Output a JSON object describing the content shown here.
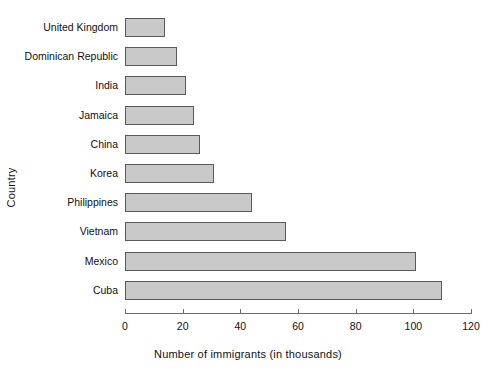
{
  "chart_data": {
    "type": "bar",
    "orientation": "horizontal",
    "title": "",
    "xlabel": "Number of immigrants (in thousands)",
    "ylabel": "Country",
    "categories": [
      "United Kingdom",
      "Dominican Republic",
      "India",
      "Jamaica",
      "China",
      "Korea",
      "Philippines",
      "Vietnam",
      "Mexico",
      "Cuba"
    ],
    "values": [
      14,
      18,
      21,
      24,
      26,
      31,
      44,
      56,
      101,
      110
    ],
    "xlim": [
      0,
      120
    ],
    "xticks": [
      0,
      20,
      40,
      60,
      80,
      100,
      120
    ],
    "xtick_labels": [
      "0",
      "20",
      "40",
      "60",
      "80",
      "100",
      "120"
    ],
    "grid": false,
    "legend": false,
    "bar_fill_color": "#c9c9c9",
    "bar_border_color": "#5a5a5a",
    "axis_color": "#6b6b6b",
    "background_color": "#ffffff"
  }
}
